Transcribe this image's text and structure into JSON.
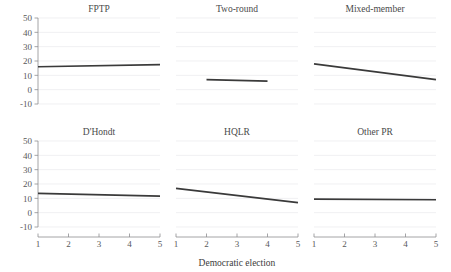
{
  "chart_data": {
    "type": "line",
    "title": "",
    "xlabel": "Democratic election",
    "ylabel": "",
    "xlim": [
      1,
      5
    ],
    "ylim": [
      -13,
      53
    ],
    "x_ticks": [
      1,
      2,
      3,
      4,
      5
    ],
    "y_ticks": [
      50,
      40,
      30,
      20,
      10,
      0,
      -10
    ],
    "grid": true,
    "legend_position": "none",
    "layout": {
      "rows": 2,
      "cols": 3
    },
    "line_color": "#3a3a3a",
    "grid_color": "#e9e9ec",
    "axis_color": "#8d8d90",
    "panels": [
      {
        "title": "FPTP",
        "row": 0,
        "col": 0,
        "x": [
          1,
          5
        ],
        "values": [
          16.0,
          17.5
        ]
      },
      {
        "title": "Two-round",
        "row": 0,
        "col": 1,
        "x": [
          2,
          4
        ],
        "values": [
          7.0,
          6.0
        ]
      },
      {
        "title": "Mixed-member",
        "row": 0,
        "col": 2,
        "x": [
          1,
          5
        ],
        "values": [
          18.0,
          7.0
        ]
      },
      {
        "title": "D'Hondt",
        "row": 1,
        "col": 0,
        "x": [
          1,
          5
        ],
        "values": [
          13.5,
          11.5
        ]
      },
      {
        "title": "HQLR",
        "row": 1,
        "col": 1,
        "x": [
          1,
          5
        ],
        "values": [
          17.0,
          7.0
        ]
      },
      {
        "title": "Other PR",
        "row": 1,
        "col": 2,
        "x": [
          1,
          5
        ],
        "values": [
          9.5,
          9.0
        ]
      }
    ]
  },
  "axis": {
    "y_tick_labels": [
      "50",
      "40",
      "30",
      "20",
      "10",
      "0",
      "-10"
    ],
    "x_tick_labels": [
      "1",
      "2",
      "3",
      "4",
      "5"
    ],
    "x_axis_title": "Democratic election"
  },
  "panel_titles": {
    "fptp": "FPTP",
    "two_round": "Two-round",
    "mixed_member": "Mixed-member",
    "dhondt": "D'Hondt",
    "hqlr": "HQLR",
    "other_pr": "Other PR"
  }
}
